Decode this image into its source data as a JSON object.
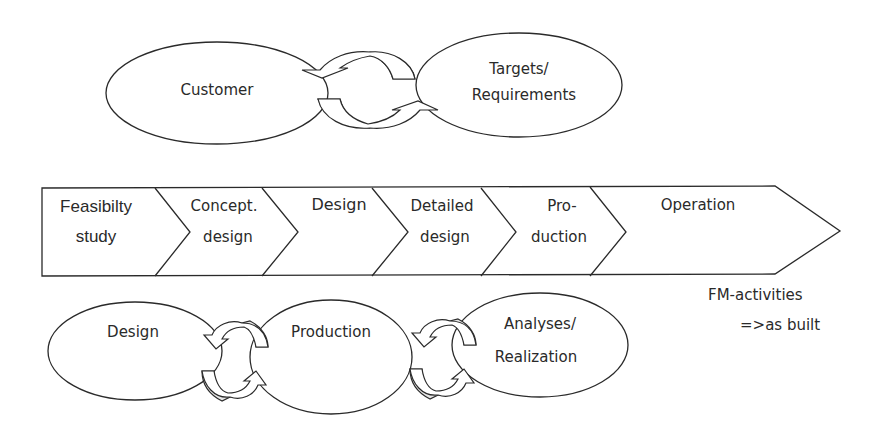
{
  "top_cycle": {
    "left_node": "Customer",
    "right_node_line1": "Targets/",
    "right_node_line2": "Requirements"
  },
  "phases": [
    {
      "line1": "Feasibilty",
      "line2": "study"
    },
    {
      "line1": "Concept.",
      "line2": "design"
    },
    {
      "line1": "Design",
      "line2": ""
    },
    {
      "line1": "Detailed",
      "line2": "design"
    },
    {
      "line1": "Pro-",
      "line2": "duction"
    },
    {
      "line1": "Operation",
      "line2": ""
    }
  ],
  "bottom_cycle": {
    "nodes": [
      {
        "line1": "Design",
        "line2": ""
      },
      {
        "line1": "Production",
        "line2": ""
      },
      {
        "line1": "Analyses/",
        "line2": "Realization"
      }
    ]
  },
  "notes": {
    "line1": "FM-activities",
    "line2": "=>as built"
  },
  "colors": {
    "stroke": "#2a2a2a",
    "arrow_shade": "#e6e6e6",
    "background": "#ffffff"
  }
}
